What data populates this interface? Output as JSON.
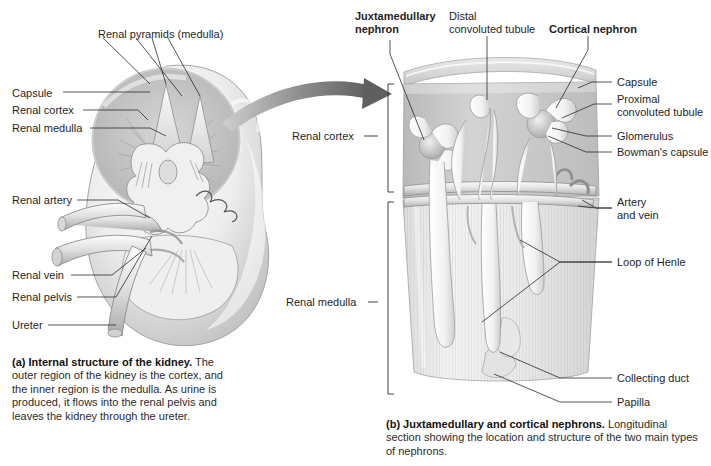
{
  "figure": {
    "background": "#ffffff",
    "ink": "#1f1f1f"
  },
  "panel_a": {
    "id": "a",
    "labels": [
      {
        "name": "renal-pyramids",
        "text": "Renal pyramids (medulla)",
        "bold": false,
        "x": 98,
        "y": 28,
        "align": "left"
      },
      {
        "name": "capsule",
        "text": "Capsule",
        "bold": false,
        "x": 12,
        "y": 93,
        "align": "left"
      },
      {
        "name": "renal-cortex",
        "text": "Renal cortex",
        "bold": false,
        "x": 12,
        "y": 110,
        "align": "left"
      },
      {
        "name": "renal-medulla",
        "text": "Renal medulla",
        "bold": false,
        "x": 12,
        "y": 127,
        "align": "left"
      },
      {
        "name": "renal-artery",
        "text": "Renal artery",
        "bold": false,
        "x": 12,
        "y": 198,
        "align": "left"
      },
      {
        "name": "renal-vein",
        "text": "Renal vein",
        "bold": false,
        "x": 12,
        "y": 273,
        "align": "left"
      },
      {
        "name": "renal-pelvis",
        "text": "Renal pelvis",
        "bold": false,
        "x": 12,
        "y": 295,
        "align": "left"
      },
      {
        "name": "ureter",
        "text": "Ureter",
        "bold": false,
        "x": 12,
        "y": 323,
        "align": "left"
      }
    ],
    "caption": {
      "lead": "(a) Internal structure of the kidney.",
      "body": " The outer region of the kidney is the cortex, and the inner region is the medulla. As urine is produced, it flows into the renal pelvis and leaves the kidney through the ureter."
    }
  },
  "panel_b": {
    "id": "b",
    "labels": [
      {
        "name": "juxtamedullary-nephron",
        "text": "Juxtamedullary\nnephron",
        "bold": true,
        "x": 355,
        "y": 10,
        "align": "left"
      },
      {
        "name": "distal-convoluted-tubule",
        "text": "Distal\nconvoluted tubule",
        "bold": false,
        "x": 449,
        "y": 10,
        "align": "left"
      },
      {
        "name": "cortical-nephron",
        "text": "Cortical nephron",
        "bold": true,
        "x": 549,
        "y": 23,
        "align": "left"
      },
      {
        "name": "capsule",
        "text": "Capsule",
        "bold": false,
        "x": 616,
        "y": 78,
        "align": "left"
      },
      {
        "name": "proximal-convoluted-tubule",
        "text": "Proximal\nconvoluted tubule",
        "bold": false,
        "x": 616,
        "y": 95,
        "align": "left"
      },
      {
        "name": "glomerulus",
        "text": "Glomerulus",
        "bold": false,
        "x": 616,
        "y": 131,
        "align": "left"
      },
      {
        "name": "bowmans-capsule",
        "text": "Bowman's capsule",
        "bold": false,
        "x": 616,
        "y": 148,
        "align": "left"
      },
      {
        "name": "renal-cortex-bracket",
        "text": "Renal cortex",
        "bold": false,
        "x": 310,
        "y": 131,
        "align": "left"
      },
      {
        "name": "renal-medulla-bracket",
        "text": "Renal medulla",
        "bold": false,
        "x": 303,
        "y": 297,
        "align": "left"
      },
      {
        "name": "artery-and-vein",
        "text": "Artery\nand vein",
        "bold": false,
        "x": 616,
        "y": 203,
        "align": "left"
      },
      {
        "name": "loop-of-henle",
        "text": "Loop of Henle",
        "bold": false,
        "x": 616,
        "y": 258,
        "align": "left"
      },
      {
        "name": "collecting-duct",
        "text": "Collecting duct",
        "bold": false,
        "x": 616,
        "y": 374,
        "align": "left"
      },
      {
        "name": "papilla",
        "text": "Papilla",
        "bold": false,
        "x": 616,
        "y": 398,
        "align": "left"
      }
    ],
    "caption": {
      "lead": "(b) Juxtamedullary and cortical nephrons.",
      "body": " Longitudinal section showing the location and structure of the two main types of nephrons."
    }
  },
  "connector": {
    "name": "transition-arrow",
    "description": "curved gray arrow from kidney to nephron panel",
    "color": "#6e6e6e"
  },
  "palette": {
    "cortex_fill": "#c9c9c9",
    "medulla_fill": "#dcdcdc",
    "tubule_fill": "#f4f4f4",
    "outline": "#8a8a8a",
    "leader": "#2b2b2b"
  }
}
